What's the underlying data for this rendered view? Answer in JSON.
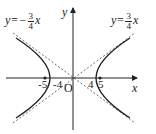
{
  "diagram": {
    "type": "hyperbola",
    "axes": {
      "x_label": "x",
      "y_label": "y",
      "origin_label": "O"
    },
    "ticks": [
      "-5",
      "-4",
      "4",
      "5"
    ],
    "asymptotes": {
      "left": {
        "prefix": "y=−",
        "num": "3",
        "den": "4",
        "var": "x"
      },
      "right": {
        "prefix": "y=",
        "num": "3",
        "den": "4",
        "var": "x"
      }
    },
    "colors": {
      "curve": "#222222",
      "asymptote": "#444444"
    }
  }
}
